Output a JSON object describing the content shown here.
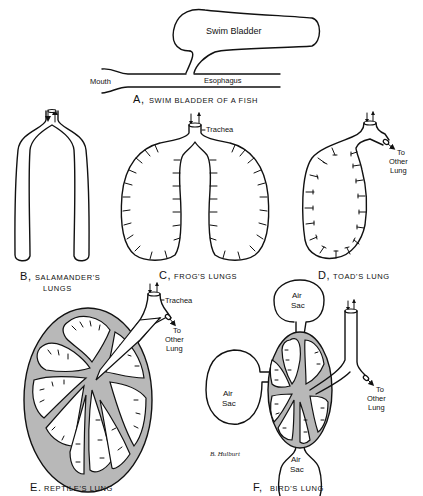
{
  "panels": {
    "a": {
      "caption_letter": "A,",
      "caption": "SWIM BLADDER OF A FISH",
      "labels": {
        "swim_bladder": "Swim Bladder",
        "mouth": "Mouth",
        "esophagus": "Esophagus"
      }
    },
    "b": {
      "caption_letter": "B,",
      "caption_line1": "SALAMANDER'S",
      "caption_line2": "LUNGS"
    },
    "c": {
      "caption_letter": "C,",
      "caption": "FROG'S LUNGS",
      "labels": {
        "trachea": "Trachea"
      }
    },
    "d": {
      "caption_letter": "D,",
      "caption": "TOAD'S LUNG",
      "labels": {
        "to": "To",
        "other": "Other",
        "lung": "Lung"
      }
    },
    "e": {
      "caption_letter": "E.",
      "caption": "REPTILE'S LUNG",
      "labels": {
        "trachea": "Trachea",
        "to": "To",
        "other": "Other",
        "lung": "Lung"
      }
    },
    "f": {
      "caption_letter": "F,",
      "caption": "BIRD'S LUNG",
      "labels": {
        "air": "Air",
        "sac": "Sac",
        "to": "To",
        "other": "Other",
        "lung": "Lung"
      },
      "signature": "B. Hulburt"
    }
  },
  "colors": {
    "ink": "#111111",
    "shading": "#b8b8b8",
    "background": "#ffffff"
  }
}
